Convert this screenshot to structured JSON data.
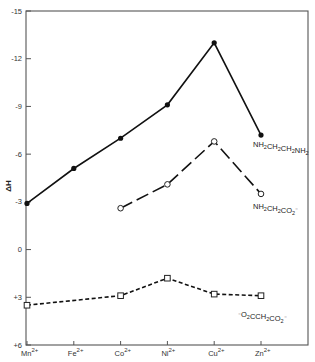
{
  "chart_data": {
    "type": "line",
    "title": "",
    "xlabel": "",
    "ylabel": "ΔH",
    "ylim": [
      -15,
      6
    ],
    "y_inverted": true,
    "yticks": [
      -15,
      -12,
      -9,
      -6,
      -3,
      0,
      3,
      6
    ],
    "ytick_labels": [
      "-15",
      "-12",
      "-9",
      "-6",
      "-3",
      "0",
      "+3",
      "+6"
    ],
    "categories": [
      "Mn",
      "Fe",
      "Co",
      "Ni",
      "Cu",
      "Zn"
    ],
    "category_charge": "2+",
    "grid": false,
    "legend": "inline labels at right end of each series",
    "series": [
      {
        "name": "NH2CH2CH2NH2",
        "label_parts": [
          [
            "NH",
            "2"
          ],
          [
            "CH",
            "2"
          ],
          [
            "CH",
            "2"
          ],
          [
            "NH",
            "2"
          ]
        ],
        "label_suffix": "",
        "marker": "filled-circle",
        "line": "solid",
        "values": [
          -2.9,
          -5.1,
          -7.0,
          -9.1,
          -13.0,
          -7.2
        ]
      },
      {
        "name": "NH2CH2CO2-",
        "label_parts": [
          [
            "NH",
            "2"
          ],
          [
            "CH",
            "2"
          ],
          [
            "CO",
            "2"
          ]
        ],
        "label_suffix": "⁻",
        "marker": "open-circle",
        "line": "long-dash",
        "values": [
          null,
          null,
          -2.6,
          -4.1,
          -6.8,
          -3.5
        ]
      },
      {
        "name": "-O2CCH2CO2-",
        "label_prefix": "⁻",
        "label_parts": [
          [
            "O",
            "2"
          ],
          [
            "CCH",
            "2"
          ],
          [
            "CO",
            "2"
          ]
        ],
        "label_suffix": "⁻",
        "marker": "open-square",
        "line": "short-dash",
        "values": [
          3.5,
          null,
          2.9,
          1.8,
          2.8,
          2.9
        ]
      }
    ]
  }
}
